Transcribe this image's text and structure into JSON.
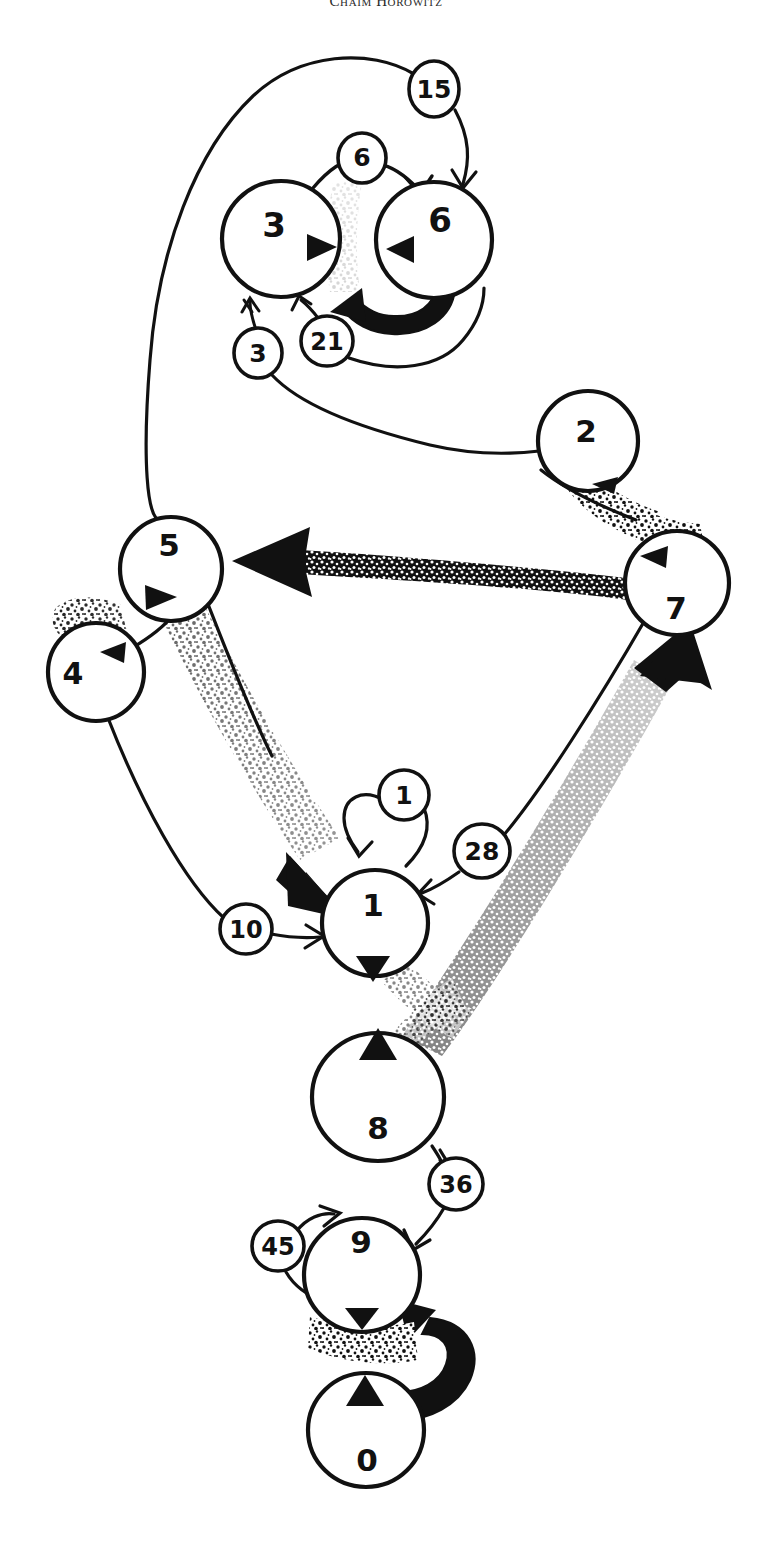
{
  "page": {
    "header_text": "Chaim Horowitz",
    "ink_color": "#111111",
    "background_color": "#ffffff"
  },
  "diagram": {
    "type": "node-link-graph",
    "style": "hand-drawn ink sketch with stippled thick edges",
    "nodes": [
      {
        "id": "node-3",
        "label": "3",
        "cx": 281,
        "cy": 239,
        "r": 59,
        "marker": "triangle-right",
        "marker_dx": 38,
        "marker_dy": 8,
        "label_dx": -7,
        "label_dy": -12
      },
      {
        "id": "node-6",
        "label": "6",
        "cx": 434,
        "cy": 240,
        "r": 58,
        "marker": "triangle-left",
        "marker_dx": -45,
        "marker_dy": 9,
        "label_dx": 6,
        "label_dy": -18
      },
      {
        "id": "node-2",
        "label": "2",
        "cx": 588,
        "cy": 441,
        "r": 50,
        "marker": "triangle-left",
        "marker_dx": 20,
        "marker_dy": 44,
        "label_dx": -2,
        "label_dy": -8
      },
      {
        "id": "node-5",
        "label": "5",
        "cx": 171,
        "cy": 569,
        "r": 51,
        "marker": "triangle-right",
        "marker_dx": -12,
        "marker_dy": 28,
        "label_dx": -2,
        "label_dy": -22
      },
      {
        "id": "node-7",
        "label": "7",
        "cx": 677,
        "cy": 583,
        "r": 52,
        "marker": "triangle-left",
        "marker_dx": -17,
        "marker_dy": -28,
        "label_dx": -1,
        "label_dy": 27
      },
      {
        "id": "node-4",
        "label": "4",
        "cx": 96,
        "cy": 672,
        "r": 48,
        "marker": "triangle-left",
        "marker_dx": 17,
        "marker_dy": -21,
        "label_dx": -23,
        "label_dy": 3
      },
      {
        "id": "node-1",
        "label": "1",
        "cx": 375,
        "cy": 923,
        "r": 53,
        "marker": "triangle-down",
        "marker_dx": -3,
        "marker_dy": 43,
        "label_dx": -2,
        "label_dy": -16
      },
      {
        "id": "node-8",
        "label": "8",
        "cx": 378,
        "cy": 1097,
        "r": 66,
        "marker": "triangle-up",
        "marker_dx": 0,
        "marker_dy": -47,
        "label_dx": 0,
        "label_dy": 33
      },
      {
        "id": "node-9",
        "label": "9",
        "cx": 362,
        "cy": 1275,
        "r": 58,
        "marker": "triangle-down",
        "marker_dx": 0,
        "marker_dy": 38,
        "label_dx": -1,
        "label_dy": -31
      },
      {
        "id": "node-0",
        "label": "0",
        "cx": 366,
        "cy": 1430,
        "r": 58,
        "marker": "triangle-up",
        "marker_dx": -1,
        "marker_dy": -39,
        "label_dx": 1,
        "label_dy": 29
      }
    ],
    "edge_labels": [
      {
        "id": "edge-label-15",
        "label": "15",
        "cx": 434,
        "cy": 89,
        "rx": 25,
        "ry": 28
      },
      {
        "id": "edge-label-6",
        "label": "6",
        "cx": 362,
        "cy": 158,
        "rx": 24,
        "ry": 25
      },
      {
        "id": "edge-label-3",
        "label": "3",
        "cx": 258,
        "cy": 353,
        "rx": 24,
        "ry": 25
      },
      {
        "id": "edge-label-21",
        "label": "21",
        "cx": 327,
        "cy": 341,
        "rx": 25,
        "ry": 25
      },
      {
        "id": "edge-label-1",
        "label": "1",
        "cx": 404,
        "cy": 795,
        "rx": 25,
        "ry": 25
      },
      {
        "id": "edge-label-28",
        "label": "28",
        "cx": 482,
        "cy": 851,
        "rx": 27,
        "ry": 27
      },
      {
        "id": "edge-label-10",
        "label": "10",
        "cx": 246,
        "cy": 929,
        "rx": 25,
        "ry": 25
      },
      {
        "id": "edge-label-36",
        "label": "36",
        "cx": 456,
        "cy": 1184,
        "rx": 26,
        "ry": 26
      },
      {
        "id": "edge-label-45",
        "label": "45",
        "cx": 278,
        "cy": 1246,
        "rx": 25,
        "ry": 25
      }
    ],
    "edges": [
      {
        "id": "edge-3-to-6",
        "from": "node-3",
        "to": "node-6",
        "weight_label": "6",
        "style": "thin-arc"
      },
      {
        "id": "edge-6-loop",
        "from": "node-6",
        "to": "node-3",
        "weight_label": "21",
        "style": "thick-black-curve"
      },
      {
        "id": "edge-15-to-6",
        "from": "edge-label-15",
        "to": "node-6",
        "weight_label": "15",
        "style": "thin-arc"
      },
      {
        "id": "edge-3-in",
        "from": "edge-label-3",
        "to": "node-3",
        "weight_label": "3",
        "style": "thin-arc"
      },
      {
        "id": "edge-2-to-5",
        "from": "node-7",
        "to": "node-5",
        "weight_label": "",
        "style": "thick-stipple-arrow"
      },
      {
        "id": "edge-5-to-1",
        "from": "node-5",
        "to": "node-1",
        "weight_label": "",
        "style": "thick-stipple-arrow"
      },
      {
        "id": "edge-4-to-1",
        "from": "node-4",
        "to": "node-1",
        "weight_label": "10",
        "style": "thin-arc"
      },
      {
        "id": "edge-7-to-1",
        "from": "node-7",
        "to": "node-1",
        "weight_label": "28",
        "style": "thin-arc"
      },
      {
        "id": "edge-1-loop",
        "from": "node-1",
        "to": "node-1",
        "weight_label": "1",
        "style": "self-loop"
      },
      {
        "id": "edge-8-to-7",
        "from": "node-8",
        "to": "node-7",
        "weight_label": "",
        "style": "thick-stipple-arrow"
      },
      {
        "id": "edge-8-to-9",
        "from": "node-8",
        "to": "node-9",
        "weight_label": "36",
        "style": "thin-arc"
      },
      {
        "id": "edge-9-loop",
        "from": "node-9",
        "to": "node-9",
        "weight_label": "45",
        "style": "self-loop"
      },
      {
        "id": "edge-0-to-9",
        "from": "node-0",
        "to": "node-9",
        "weight_label": "",
        "style": "thick-black-curve"
      }
    ]
  }
}
